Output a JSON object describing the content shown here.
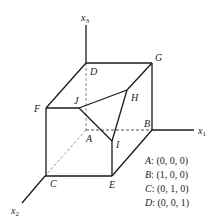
{
  "diagram": {
    "axes": [
      {
        "name": "x1",
        "base": "x",
        "sub": "1"
      },
      {
        "name": "x2",
        "base": "x",
        "sub": "2"
      },
      {
        "name": "x3",
        "base": "x",
        "sub": "3"
      }
    ],
    "vertices": {
      "A": "A",
      "B": "B",
      "C": "C",
      "D": "D",
      "E": "E",
      "F": "F",
      "G": "G",
      "H": "H",
      "I": "I",
      "J": "J"
    },
    "legend": [
      {
        "key": "A",
        "value": ": (0, 0, 0)"
      },
      {
        "key": "B",
        "value": ": (1, 0, 0)"
      },
      {
        "key": "C",
        "value": ": (0, 1, 0)"
      },
      {
        "key": "D",
        "value": ": (0, 0, 1)"
      }
    ],
    "colors": {
      "line": "#1a1a1a",
      "hidden": "#888888",
      "background": "#ffffff"
    }
  }
}
